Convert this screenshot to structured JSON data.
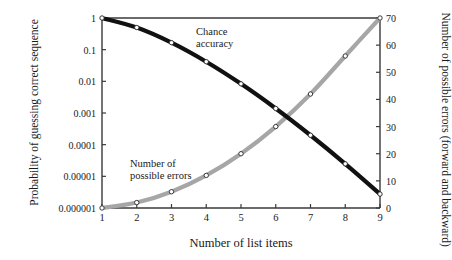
{
  "chart_data": {
    "type": "line",
    "title": "",
    "xlabel": "Number of list items",
    "x": [
      1,
      2,
      3,
      4,
      5,
      6,
      7,
      8,
      9
    ],
    "xlim": [
      1,
      9
    ],
    "xticks": [
      "1",
      "2",
      "3",
      "4",
      "5",
      "6",
      "7",
      "8",
      "9"
    ],
    "grid": false,
    "legend_position": "inline-annotations",
    "axes": [
      {
        "id": "left",
        "label": "Probability of guessing correct sequence",
        "scale": "log",
        "ylim": [
          1e-06,
          1
        ],
        "ticks": [
          1,
          0.1,
          0.01,
          0.001,
          0.0001,
          1e-05,
          1e-06
        ],
        "ticklabels": [
          "1",
          "0.1",
          "0.01",
          "0.001",
          "0.0001",
          "0.00001",
          "0.000001"
        ]
      },
      {
        "id": "right",
        "label": "Number of possible errors (forward and backward)",
        "scale": "linear",
        "ylim": [
          0,
          70
        ],
        "ticks": [
          0,
          10,
          20,
          30,
          40,
          50,
          60,
          70
        ],
        "ticklabels": [
          "0",
          "10",
          "20",
          "30",
          "40",
          "50",
          "60",
          "70"
        ]
      }
    ],
    "series": [
      {
        "name": "Chance accuracy",
        "axis": "left",
        "color": "#111111",
        "marker": "open-circle",
        "values": [
          1,
          0.5,
          0.1667,
          0.04167,
          0.008333,
          0.001389,
          0.0001984,
          2.48e-05,
          2.76e-06
        ]
      },
      {
        "name": "Number of possible errors",
        "axis": "right",
        "color": "#a6a6a6",
        "marker": "open-circle",
        "values": [
          0,
          2,
          6,
          12,
          20,
          30,
          42,
          56,
          72
        ]
      }
    ],
    "annotations": [
      {
        "id": "chance-accuracy",
        "text": "Chance\naccuracy",
        "line1": "Chance",
        "line2": "accuracy"
      },
      {
        "id": "possible-errors",
        "text": "Number of\npossible errors",
        "line1": "Number of",
        "line2": "possible errors"
      }
    ]
  },
  "labels": {
    "y_left_title": "Probability of guessing correct sequence",
    "y_right_title": "Number of possible errors (forward and backward)",
    "x_title": "Number of list items",
    "annot_chance_l1": "Chance",
    "annot_chance_l2": "accuracy",
    "annot_errors_l1": "Number of",
    "annot_errors_l2": "possible errors"
  },
  "ticks": {
    "left": [
      "1",
      "0.1",
      "0.01",
      "0.001",
      "0.0001",
      "0.00001",
      "0.000001"
    ],
    "right": [
      "70",
      "60",
      "50",
      "40",
      "30",
      "20",
      "10",
      "0"
    ],
    "x": [
      "1",
      "2",
      "3",
      "4",
      "5",
      "6",
      "7",
      "8",
      "9"
    ]
  },
  "colors": {
    "chance_curve": "#111111",
    "errors_curve": "#a6a6a6",
    "axis": "#3a3a3a",
    "marker_fill": "#ffffff"
  }
}
